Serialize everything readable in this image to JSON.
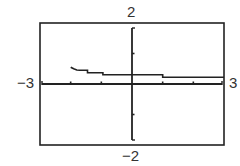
{
  "chart_data": {
    "type": "line",
    "title": "",
    "xlabel": "",
    "ylabel": "",
    "xlim": [
      -3,
      3
    ],
    "ylim": [
      -2,
      2
    ],
    "window_labels": {
      "xmin": "−3",
      "xmax": "3",
      "ymin": "−2",
      "ymax": "2"
    },
    "x_ticks": [
      -2,
      -1,
      1,
      2
    ],
    "y_ticks": [
      -1,
      1
    ],
    "grid": false,
    "legend": "none",
    "series": [
      {
        "name": "graph",
        "style": "stepped",
        "x": [
          -2.0,
          -1.9,
          -1.8,
          -1.7,
          -1.45,
          -1.45,
          -0.95,
          -0.95,
          1.0,
          1.0,
          3.0
        ],
        "y": [
          0.55,
          0.5,
          0.46,
          0.45,
          0.45,
          0.37,
          0.37,
          0.3,
          0.3,
          0.22,
          0.22
        ]
      }
    ],
    "colors": {
      "frame": "#222222",
      "axes": "#222222",
      "curve": "#222222"
    }
  }
}
